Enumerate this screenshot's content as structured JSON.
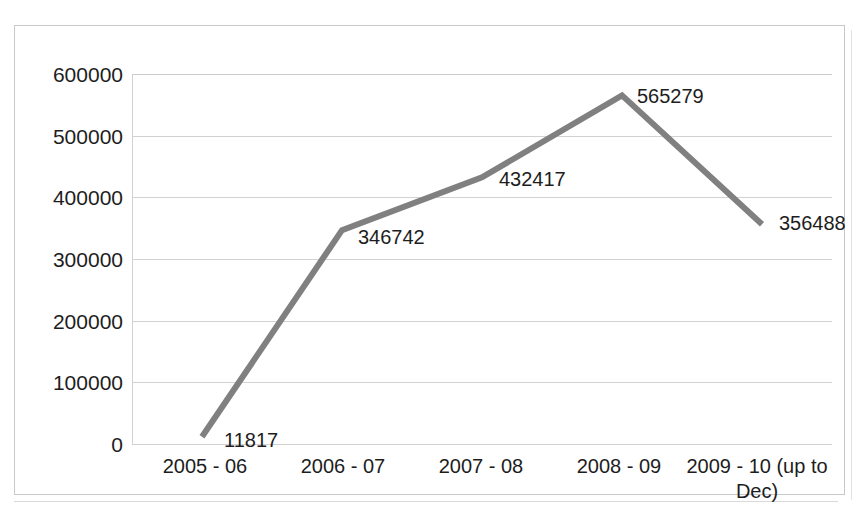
{
  "chart_data": {
    "type": "line",
    "title": "",
    "subtitle": "",
    "xlabel": "",
    "ylabel": "",
    "categories": [
      "2005 - 06",
      "2006 - 07",
      "2007 - 08",
      "2008 - 09",
      "2009 - 10 (up to Dec)"
    ],
    "values": [
      11817,
      346742,
      432417,
      565279,
      356488
    ],
    "data_labels": [
      "11817",
      "346742",
      "432417",
      "565279",
      "356488"
    ],
    "ylim": [
      0,
      600000
    ],
    "ytick_values": [
      600000,
      500000,
      400000,
      300000,
      200000,
      100000,
      0
    ],
    "ytick_labels": [
      "600000",
      "500000",
      "400000",
      "300000",
      "200000",
      "100000",
      "0"
    ],
    "grid": "horizontal",
    "legend": "none",
    "series": [
      {
        "name": "",
        "values": [
          11817,
          346742,
          432417,
          565279,
          356488
        ],
        "color": "#808080",
        "line_width": 6,
        "markers": "none"
      }
    ],
    "colors": {
      "line": "#808080",
      "gridline": "#d2d2d2",
      "frame": "#c9c9c9",
      "text": "#1d1d1d",
      "background": "#ffffff"
    }
  }
}
